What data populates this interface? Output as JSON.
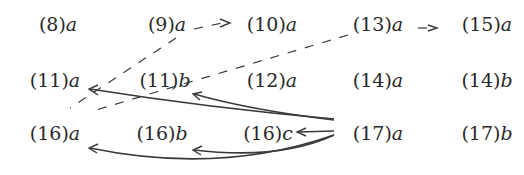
{
  "diagram": {
    "nodes": [
      {
        "id": "8a",
        "num": "(8)",
        "var": "a",
        "x": 58,
        "y": 24
      },
      {
        "id": "9a",
        "num": "(9)",
        "var": "a",
        "x": 167,
        "y": 24
      },
      {
        "id": "10a",
        "num": "(10)",
        "var": "a",
        "x": 272,
        "y": 24
      },
      {
        "id": "13a",
        "num": "(13)",
        "var": "a",
        "x": 378,
        "y": 24
      },
      {
        "id": "15a",
        "num": "(15)",
        "var": "a",
        "x": 487,
        "y": 24
      },
      {
        "id": "11a",
        "num": "(11)",
        "var": "a",
        "x": 55,
        "y": 80
      },
      {
        "id": "11b",
        "num": "(11)",
        "var": "b",
        "x": 165,
        "y": 80
      },
      {
        "id": "12a",
        "num": "(12)",
        "var": "a",
        "x": 272,
        "y": 80
      },
      {
        "id": "14a",
        "num": "(14)",
        "var": "a",
        "x": 378,
        "y": 80
      },
      {
        "id": "14b",
        "num": "(14)",
        "var": "b",
        "x": 487,
        "y": 80
      },
      {
        "id": "16a",
        "num": "(16)",
        "var": "a",
        "x": 55,
        "y": 133
      },
      {
        "id": "16b",
        "num": "(16)",
        "var": "b",
        "x": 162,
        "y": 133
      },
      {
        "id": "16c",
        "num": "(16)",
        "var": "c",
        "x": 268,
        "y": 133
      },
      {
        "id": "17a",
        "num": "(17)",
        "var": "a",
        "x": 378,
        "y": 133
      },
      {
        "id": "17b",
        "num": "(17)",
        "var": "b",
        "x": 487,
        "y": 133
      }
    ],
    "edges": [
      {
        "from": "9a",
        "to": "10a",
        "style": "dashed"
      },
      {
        "from": "13a",
        "to": "15a",
        "style": "dashed"
      },
      {
        "from": "9a",
        "to": "16a",
        "style": "dashed"
      },
      {
        "from": "13a",
        "to": "11b",
        "style": "dashed"
      },
      {
        "from": "17a",
        "to": "11a",
        "style": "solid"
      },
      {
        "from": "17a",
        "to": "11b",
        "style": "solid"
      },
      {
        "from": "17a",
        "to": "16a",
        "style": "solid"
      },
      {
        "from": "17a",
        "to": "16b",
        "style": "solid"
      },
      {
        "from": "17a",
        "to": "16c",
        "style": "solid"
      }
    ],
    "colors": {
      "ink": "#2a2a2a",
      "background": "#ffffff"
    }
  }
}
